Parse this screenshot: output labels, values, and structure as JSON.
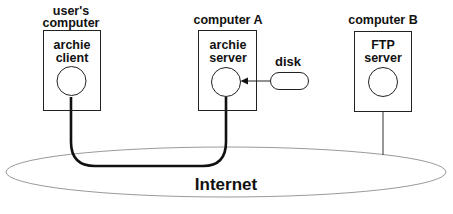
{
  "diagram": {
    "nodes": {
      "user_computer": {
        "title_line1": "user's",
        "title_line2": "computer",
        "process_line1": "archie",
        "process_line2": "client"
      },
      "computer_a": {
        "title": "computer A",
        "process_line1": "archie",
        "process_line2": "server"
      },
      "disk": {
        "label": "disk"
      },
      "computer_b": {
        "title": "computer B",
        "process_line1": "FTP",
        "process_line2": "server"
      },
      "internet": {
        "label": "Internet"
      }
    },
    "edges": [
      {
        "from": "archie client",
        "to": "archie server",
        "via": "Internet",
        "style": "thick"
      },
      {
        "from": "disk",
        "to": "archie server",
        "style": "arrow"
      },
      {
        "from": "FTP server",
        "to": "Internet",
        "style": "thin"
      }
    ],
    "colors": {
      "stroke": "#111111",
      "ellipse_stroke": "#9a9a9a",
      "background": "#ffffff"
    }
  }
}
